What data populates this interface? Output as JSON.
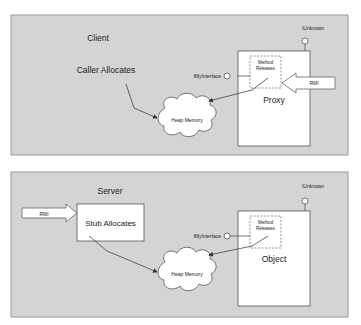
{
  "panels": {
    "client": {
      "title": "Client",
      "caller_label": "Caller Allocates",
      "heap_label": "Heap Memory",
      "box_label": "Proxy",
      "inner_label_line1": "Method",
      "inner_label_line2": "Releases",
      "interface_label": "IMyInterface",
      "unknown_label": "IUnknown",
      "rmi_label": "RMI"
    },
    "server": {
      "title": "Server",
      "stub_label": "Stub Allocates",
      "heap_label": "Heap Memory",
      "box_label": "Object",
      "inner_label_line1": "Method",
      "inner_label_line2": "Releases",
      "interface_label": "IMyInterface",
      "unknown_label": "IUnknown",
      "rmi_label": "RMI"
    }
  },
  "colors": {
    "panel_bg": "#d4d4d4",
    "panel_border": "#9a9a9a",
    "box_bg": "#ffffff",
    "line": "#444444"
  }
}
